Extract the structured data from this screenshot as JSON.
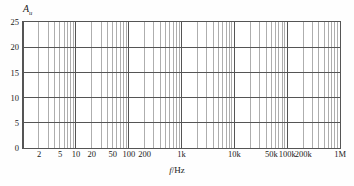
{
  "chart_data": {
    "type": "line",
    "title": "",
    "subtitle": "",
    "xlabel": "f/Hz",
    "xlabel_italic_part": "f",
    "xlabel_rest": "/Hz",
    "ylabel": "Au",
    "ylabel_base": "A",
    "ylabel_sub": "u",
    "xscale": "log",
    "yscale": "linear",
    "xlim": [
      1,
      1000000
    ],
    "ylim": [
      0,
      25
    ],
    "grid": true,
    "legend": null,
    "series": [],
    "annotations": [],
    "y_ticks": [
      {
        "value": 0,
        "label": "0"
      },
      {
        "value": 5,
        "label": "5"
      },
      {
        "value": 10,
        "label": "10"
      },
      {
        "value": 15,
        "label": "15"
      },
      {
        "value": 20,
        "label": "20"
      },
      {
        "value": 25,
        "label": "25"
      }
    ],
    "x_ticks": [
      {
        "value": 2,
        "label": "2"
      },
      {
        "value": 5,
        "label": "5"
      },
      {
        "value": 10,
        "label": "10"
      },
      {
        "value": 20,
        "label": "20"
      },
      {
        "value": 50,
        "label": "50"
      },
      {
        "value": 100,
        "label": "100"
      },
      {
        "value": 200,
        "label": "200"
      },
      {
        "value": 1000,
        "label": "1k"
      },
      {
        "value": 10000,
        "label": "10k"
      },
      {
        "value": 50000,
        "label": "50k"
      },
      {
        "value": 100000,
        "label": "100k"
      },
      {
        "value": 200000,
        "label": "200k"
      },
      {
        "value": 1000000,
        "label": "1M"
      }
    ],
    "x_minor_gridlines_per_decade": [
      1,
      2,
      3,
      4,
      5,
      6,
      7,
      8,
      9
    ],
    "y_minor_gridlines": [],
    "colors": {
      "grid_minor": "#8c8c8c",
      "grid_major": "#555555",
      "border": "#555555",
      "text": "#1a1a1a",
      "background": "#ffffff",
      "page_background": "#fefefe"
    }
  }
}
